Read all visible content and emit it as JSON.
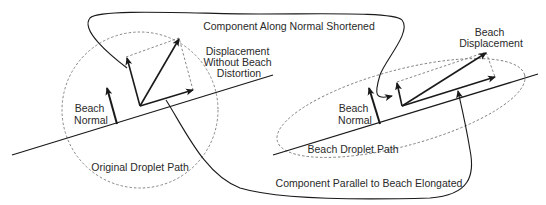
{
  "figure": {
    "left_panel": {
      "labels": {
        "beach_normal_line1": "Beach",
        "beach_normal_line2": "Normal",
        "displacement_line1": "Displacement",
        "displacement_line2": "Without Beach",
        "displacement_line3": "Distortion",
        "droplet_path": "Original Droplet Path"
      }
    },
    "right_panel": {
      "labels": {
        "beach_normal_line1": "Beach",
        "beach_normal_line2": "Normal",
        "beach_displacement_line1": "Beach",
        "beach_displacement_line2": "Displacement",
        "droplet_path": "Beach Droplet Path"
      }
    },
    "connectors": {
      "top": "Component Along Normal Shortened",
      "bottom": "Component Parallel to Beach Elongated"
    },
    "colors": {
      "line": "#1a1a1a",
      "dashed": "#7a7a7a",
      "text": "#2a2a2a"
    }
  }
}
